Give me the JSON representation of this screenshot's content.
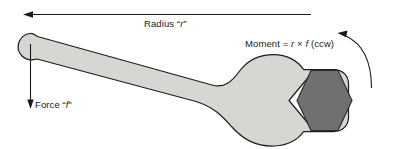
{
  "figure": {
    "labels": {
      "radius_prefix": "Radius ",
      "radius_open_quote": "“",
      "radius_symbol": "r",
      "radius_close_quote": "”",
      "force_prefix": "Force ",
      "force_open_quote": "“",
      "force_symbol": "f",
      "force_close_quote": "”",
      "moment_prefix": "Moment = ",
      "moment_radius_symbol": "r",
      "moment_times": " × ",
      "moment_force_symbol": "f",
      "moment_suffix": " (ccw)"
    },
    "colors": {
      "wrench_fill": "#d6d6d3",
      "wrench_outline": "#1f1f1f",
      "nut_fill": "#707070",
      "nut_outline": "#2a2a2a",
      "arrow": "#1a1a1a",
      "background": "#ffffff",
      "text": "#1a1a1a"
    },
    "annotations": {
      "radius_arrow_direction": "left",
      "force_arrow_direction": "down",
      "moment_arrow_direction": "counterclockwise"
    }
  }
}
